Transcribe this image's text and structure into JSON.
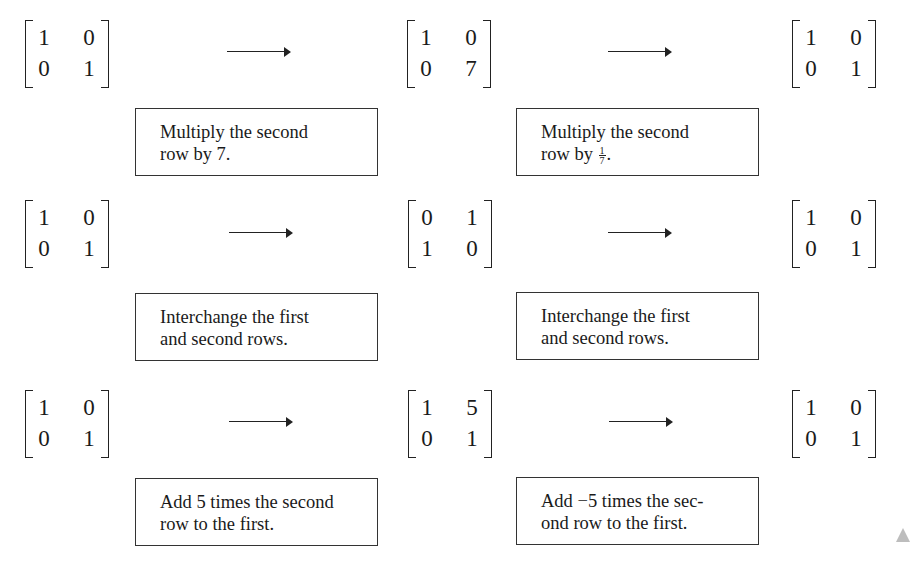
{
  "rows": [
    {
      "matrices": [
        {
          "cells": [
            "1",
            "0",
            "0",
            "1"
          ]
        },
        {
          "cells": [
            "1",
            "0",
            "0",
            "7"
          ]
        },
        {
          "cells": [
            "1",
            "0",
            "0",
            "1"
          ]
        }
      ],
      "operations": [
        {
          "line1": "Multiply the second",
          "line2": "row by 7."
        },
        {
          "line1": "Multiply the second",
          "line2_prefix": "row by ",
          "fraction": {
            "num": "1",
            "den": "7"
          },
          "line2_suffix": "."
        }
      ]
    },
    {
      "matrices": [
        {
          "cells": [
            "1",
            "0",
            "0",
            "1"
          ]
        },
        {
          "cells": [
            "0",
            "1",
            "1",
            "0"
          ]
        },
        {
          "cells": [
            "1",
            "0",
            "0",
            "1"
          ]
        }
      ],
      "operations": [
        {
          "line1": "Interchange the first",
          "line2": "and second rows."
        },
        {
          "line1": "Interchange the first",
          "line2": "and second rows."
        }
      ]
    },
    {
      "matrices": [
        {
          "cells": [
            "1",
            "0",
            "0",
            "1"
          ]
        },
        {
          "cells": [
            "1",
            "5",
            "0",
            "1"
          ]
        },
        {
          "cells": [
            "1",
            "0",
            "0",
            "1"
          ]
        }
      ],
      "operations": [
        {
          "line1": "Add 5 times the second",
          "line2": "row to the first."
        },
        {
          "line1": "Add −5 times the sec-",
          "line2": "ond row to the first."
        }
      ]
    }
  ],
  "arrow_symbol": "⟶"
}
